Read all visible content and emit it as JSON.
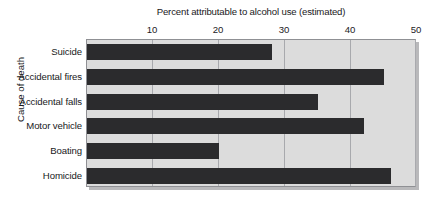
{
  "chart_data": {
    "type": "bar",
    "orientation": "horizontal",
    "title": "Percent attributable to alcohol use (estimated)",
    "xlabel": "Percent attributable to alcohol use (estimated)",
    "ylabel": "Cause of death",
    "categories": [
      "Suicide",
      "Accidental fires",
      "Accidental falls",
      "Motor vehicle",
      "Boating",
      "Homicide"
    ],
    "values": [
      28,
      45,
      35,
      42,
      20,
      46
    ],
    "xlim": [
      0,
      50
    ],
    "xticks": [
      10,
      20,
      30,
      40,
      50
    ],
    "xtick_labels": [
      "10",
      "20",
      "30",
      "40",
      "50"
    ],
    "grid": "vertical",
    "legend": "none",
    "bar_color": "#2b2b2d",
    "plot_background": "#dcdcdc",
    "axis_color": "#8f9094",
    "gridline_color": "#a8a9ad"
  },
  "axis_title": "Percent attributable to alcohol use (estimated)",
  "y_axis_title": "Cause of death",
  "ticks": [
    {
      "label": "10",
      "value": 10
    },
    {
      "label": "20",
      "value": 20
    },
    {
      "label": "30",
      "value": 30
    },
    {
      "label": "40",
      "value": 40
    },
    {
      "label": "50",
      "value": 50
    }
  ],
  "bars": [
    {
      "label": "Suicide",
      "value": 28
    },
    {
      "label": "Accidental fires",
      "value": 45
    },
    {
      "label": "Accidental falls",
      "value": 35
    },
    {
      "label": "Motor vehicle",
      "value": 42
    },
    {
      "label": "Boating",
      "value": 20
    },
    {
      "label": "Homicide",
      "value": 46
    }
  ]
}
